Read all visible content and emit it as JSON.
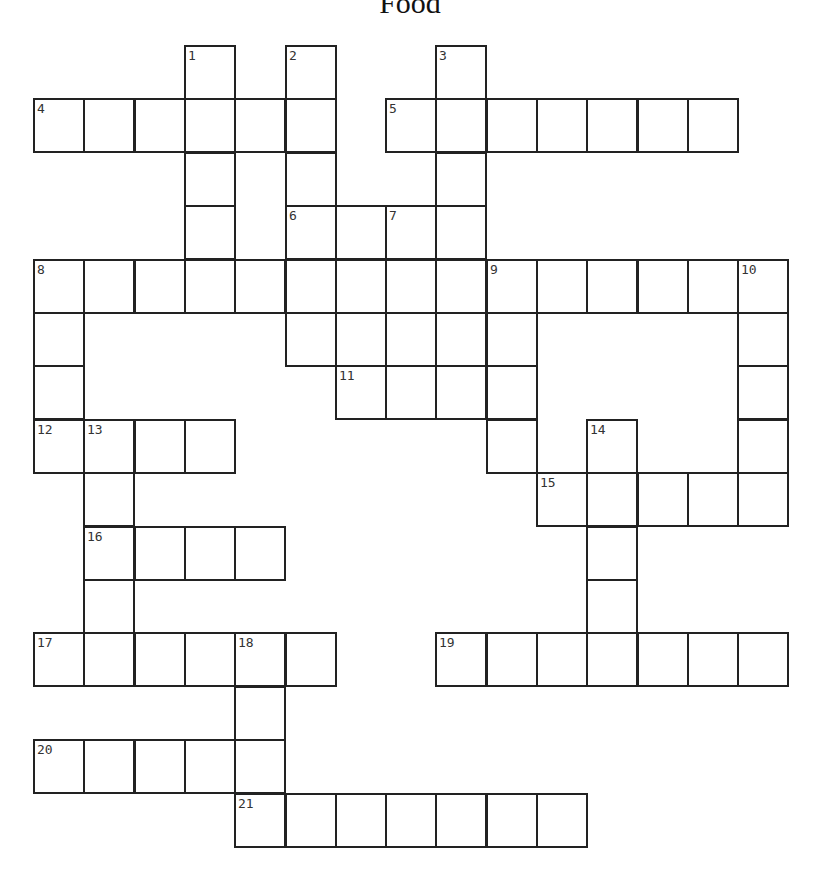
{
  "title": "Food",
  "grid": {
    "origin_x": 33,
    "origin_y": 45,
    "col_pitch": 50.3,
    "row_pitch": 53.4,
    "border_color": "#222222",
    "cells": [
      [
        0,
        3,
        "1"
      ],
      [
        0,
        5,
        "2"
      ],
      [
        0,
        8,
        "3"
      ],
      [
        1,
        0,
        "4"
      ],
      [
        1,
        1,
        ""
      ],
      [
        1,
        2,
        ""
      ],
      [
        1,
        3,
        ""
      ],
      [
        1,
        4,
        ""
      ],
      [
        1,
        5,
        ""
      ],
      [
        1,
        7,
        "5"
      ],
      [
        1,
        8,
        ""
      ],
      [
        1,
        9,
        ""
      ],
      [
        1,
        10,
        ""
      ],
      [
        1,
        11,
        ""
      ],
      [
        1,
        12,
        ""
      ],
      [
        1,
        13,
        ""
      ],
      [
        2,
        3,
        ""
      ],
      [
        2,
        5,
        ""
      ],
      [
        2,
        8,
        ""
      ],
      [
        3,
        3,
        ""
      ],
      [
        3,
        5,
        "6"
      ],
      [
        3,
        6,
        ""
      ],
      [
        3,
        7,
        "7"
      ],
      [
        3,
        8,
        ""
      ],
      [
        4,
        0,
        "8"
      ],
      [
        4,
        1,
        ""
      ],
      [
        4,
        2,
        ""
      ],
      [
        4,
        3,
        ""
      ],
      [
        4,
        4,
        ""
      ],
      [
        4,
        5,
        ""
      ],
      [
        4,
        6,
        ""
      ],
      [
        4,
        7,
        ""
      ],
      [
        4,
        8,
        ""
      ],
      [
        4,
        9,
        "9"
      ],
      [
        4,
        10,
        ""
      ],
      [
        4,
        11,
        ""
      ],
      [
        4,
        12,
        ""
      ],
      [
        4,
        13,
        ""
      ],
      [
        4,
        14,
        "10"
      ],
      [
        5,
        0,
        ""
      ],
      [
        5,
        5,
        ""
      ],
      [
        5,
        6,
        ""
      ],
      [
        5,
        7,
        ""
      ],
      [
        5,
        8,
        ""
      ],
      [
        5,
        9,
        ""
      ],
      [
        5,
        14,
        ""
      ],
      [
        6,
        0,
        ""
      ],
      [
        6,
        6,
        "11"
      ],
      [
        6,
        7,
        ""
      ],
      [
        6,
        8,
        ""
      ],
      [
        6,
        9,
        ""
      ],
      [
        6,
        14,
        ""
      ],
      [
        7,
        0,
        "12"
      ],
      [
        7,
        1,
        "13"
      ],
      [
        7,
        2,
        ""
      ],
      [
        7,
        3,
        ""
      ],
      [
        7,
        9,
        ""
      ],
      [
        7,
        11,
        "14"
      ],
      [
        7,
        14,
        ""
      ],
      [
        8,
        1,
        ""
      ],
      [
        8,
        10,
        "15"
      ],
      [
        8,
        11,
        ""
      ],
      [
        8,
        12,
        ""
      ],
      [
        8,
        13,
        ""
      ],
      [
        8,
        14,
        ""
      ],
      [
        9,
        1,
        "16"
      ],
      [
        9,
        2,
        ""
      ],
      [
        9,
        3,
        ""
      ],
      [
        9,
        4,
        ""
      ],
      [
        9,
        11,
        ""
      ],
      [
        10,
        1,
        ""
      ],
      [
        10,
        11,
        ""
      ],
      [
        11,
        0,
        "17"
      ],
      [
        11,
        1,
        ""
      ],
      [
        11,
        2,
        ""
      ],
      [
        11,
        3,
        ""
      ],
      [
        11,
        4,
        "18"
      ],
      [
        11,
        5,
        ""
      ],
      [
        11,
        8,
        "19"
      ],
      [
        11,
        9,
        ""
      ],
      [
        11,
        10,
        ""
      ],
      [
        11,
        11,
        ""
      ],
      [
        11,
        12,
        ""
      ],
      [
        11,
        13,
        ""
      ],
      [
        11,
        14,
        ""
      ],
      [
        12,
        4,
        ""
      ],
      [
        13,
        0,
        "20"
      ],
      [
        13,
        1,
        ""
      ],
      [
        13,
        2,
        ""
      ],
      [
        13,
        3,
        ""
      ],
      [
        13,
        4,
        ""
      ],
      [
        14,
        4,
        "21"
      ],
      [
        14,
        5,
        ""
      ],
      [
        14,
        6,
        ""
      ],
      [
        14,
        7,
        ""
      ],
      [
        14,
        8,
        ""
      ],
      [
        14,
        9,
        ""
      ],
      [
        14,
        10,
        ""
      ]
    ]
  }
}
